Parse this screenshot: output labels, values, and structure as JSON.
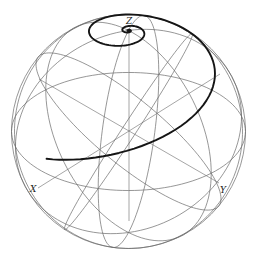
{
  "figure": {
    "width": 257,
    "height": 260,
    "colors": {
      "background": "#ffffff",
      "grid": "#6a6a6a",
      "spiral": "#151515",
      "label": "#222222"
    },
    "sphere": {
      "cx": 128.5,
      "cy": 131.5,
      "r": 117
    },
    "view": {
      "elevation_deg": 30.3,
      "azimuth_deg": 45
    },
    "meridians_deg": [
      0,
      60,
      120
    ],
    "parallels_deg": [
      0
    ],
    "axes": {
      "center": [
        129,
        131
      ],
      "z_end": [
        129,
        30
      ],
      "x_end": [
        38,
        188
      ],
      "y_end": [
        219,
        183
      ],
      "bottom": [
        129,
        221
      ]
    },
    "labels": {
      "z": {
        "text": "Z",
        "x": 126,
        "y": 24
      },
      "x": {
        "text": "X",
        "x": 30,
        "y": 192
      },
      "y": {
        "text": "Y",
        "x": 220,
        "y": 193
      }
    },
    "spiral": {
      "start_lat_deg": 8,
      "start_lon_deg": 90,
      "turns": 14,
      "lat_growth": 0.3,
      "description": "Rhumb line from Y spiralling up toward pole Z"
    }
  }
}
